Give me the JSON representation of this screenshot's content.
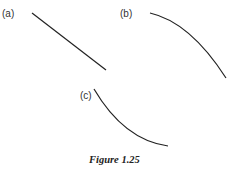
{
  "figure": {
    "caption": "Figure 1.25",
    "line_color": "#222222",
    "panels": [
      {
        "label": "(a)",
        "shape": "straight line, decreasing",
        "path": "M32,13 L106,70"
      },
      {
        "label": "(b)",
        "shape": "decreasing curve, concave down",
        "path": "M150,13 Q190,22 226,78"
      },
      {
        "label": "(c)",
        "shape": "decreasing curve, concave up",
        "path": "M94,89 Q124,140 168,146"
      }
    ]
  }
}
